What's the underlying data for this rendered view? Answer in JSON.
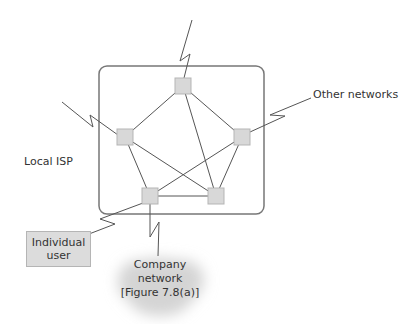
{
  "diagram": {
    "labels": {
      "other_networks": "Other networks",
      "local_isp": "Local ISP",
      "individual_user": [
        "Individual",
        "user"
      ],
      "company_network": [
        "Company",
        "network",
        "[Figure 7.8(a)]"
      ]
    },
    "colors": {
      "node_fill": "#d8d8d8",
      "node_border": "#b5b5b5",
      "line": "#555555",
      "isp_border": "#777777",
      "cloud": "#d4d4d4"
    },
    "isp_box": {
      "x": 99,
      "y": 66,
      "w": 165,
      "h": 148,
      "rx": 8
    },
    "nodes": [
      {
        "id": "top",
        "x": 175,
        "y": 78,
        "size": 16
      },
      {
        "id": "left",
        "x": 117,
        "y": 129,
        "size": 16
      },
      {
        "id": "right",
        "x": 234,
        "y": 129,
        "size": 16
      },
      {
        "id": "bottom-left",
        "x": 142,
        "y": 188,
        "size": 16
      },
      {
        "id": "bottom-right",
        "x": 208,
        "y": 188,
        "size": 16
      }
    ],
    "edges": [
      [
        "top",
        "left"
      ],
      [
        "top",
        "right"
      ],
      [
        "top",
        "bottom-right"
      ],
      [
        "left",
        "bottom-left"
      ],
      [
        "left",
        "bottom-right"
      ],
      [
        "right",
        "bottom-left"
      ],
      [
        "right",
        "bottom-right"
      ],
      [
        "bottom-left",
        "bottom-right"
      ]
    ],
    "external_links": [
      {
        "name": "top-link",
        "points": "192,20 180,61 190,54 184,78"
      },
      {
        "name": "left-link",
        "points": "62,102 93,127 90,115 118,135"
      },
      {
        "name": "other-networks-link",
        "points": "311,98 270,115 285,116 250,132"
      },
      {
        "name": "individual-user-link",
        "points": "143,203 100,219 115,224 89,234"
      },
      {
        "name": "company-network-link",
        "points": "150,204 150,237 159,222 158,256"
      }
    ]
  }
}
